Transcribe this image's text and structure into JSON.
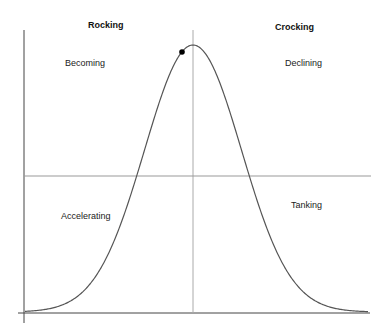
{
  "diagram": {
    "headers": {
      "left": "Rocking",
      "right": "Crocking"
    },
    "quadrants": {
      "top_left": "Becoming",
      "top_right": "Declining",
      "bottom_left": "Accelerating",
      "bottom_right": "Tanking"
    },
    "marker": {
      "description": "dot on rising curve just before peak"
    },
    "curve": {
      "type": "bell-curve",
      "color": "#555555"
    },
    "colors": {
      "axis": "#444444",
      "divider": "#999999",
      "marker": "#000000"
    }
  }
}
